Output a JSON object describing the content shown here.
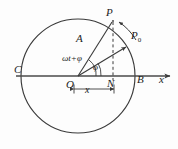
{
  "figure": {
    "type": "physics-diagram",
    "colors": {
      "background": "#fdfdfd",
      "stroke": "#3a3a3a",
      "axis": "#4a4a4a",
      "text": "#1c1c1c"
    },
    "geometry": {
      "circle_center_x": 78,
      "circle_center_y": 76,
      "circle_radius": 57,
      "axis_y": 76,
      "axis_start_x": 16,
      "axis_end_x": 172,
      "point_P_x": 113,
      "point_P_y": 21,
      "point_P0_x": 128,
      "point_P0_y": 45,
      "point_N_x": 113,
      "point_N_y": 76,
      "angle_wt_phi_deg": 58,
      "angle_phi_deg": 30
    },
    "labels": {
      "point_p": "P",
      "point_p0_base": "P",
      "point_p0_sub": "0",
      "amplitude": "A",
      "angle_total": "ωt+φ",
      "angle_phase": "φ",
      "point_c": "C",
      "point_b": "B",
      "axis_x": "x",
      "origin": "O",
      "point_n": "N",
      "displacement": "x"
    }
  }
}
